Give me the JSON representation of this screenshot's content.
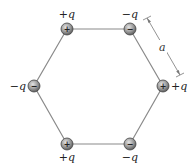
{
  "diagram": {
    "type": "hexagon-charges",
    "side_label": "a",
    "charges": [
      {
        "id": "top-left",
        "label": "+q",
        "sign": "+"
      },
      {
        "id": "top-right",
        "label": "−q",
        "sign": "−"
      },
      {
        "id": "right",
        "label": "+q",
        "sign": "+"
      },
      {
        "id": "bottom-right",
        "label": "−q",
        "sign": "−"
      },
      {
        "id": "bottom-left",
        "label": "+q",
        "sign": "+"
      },
      {
        "id": "left",
        "label": "−q",
        "sign": "−"
      }
    ],
    "colors": {
      "edge": "#8a8a8a",
      "charge_fill_light": "#d8d8d8",
      "charge_fill_dark": "#6e6e6e",
      "charge_outline": "#444444",
      "dimension_line": "#666666"
    }
  }
}
